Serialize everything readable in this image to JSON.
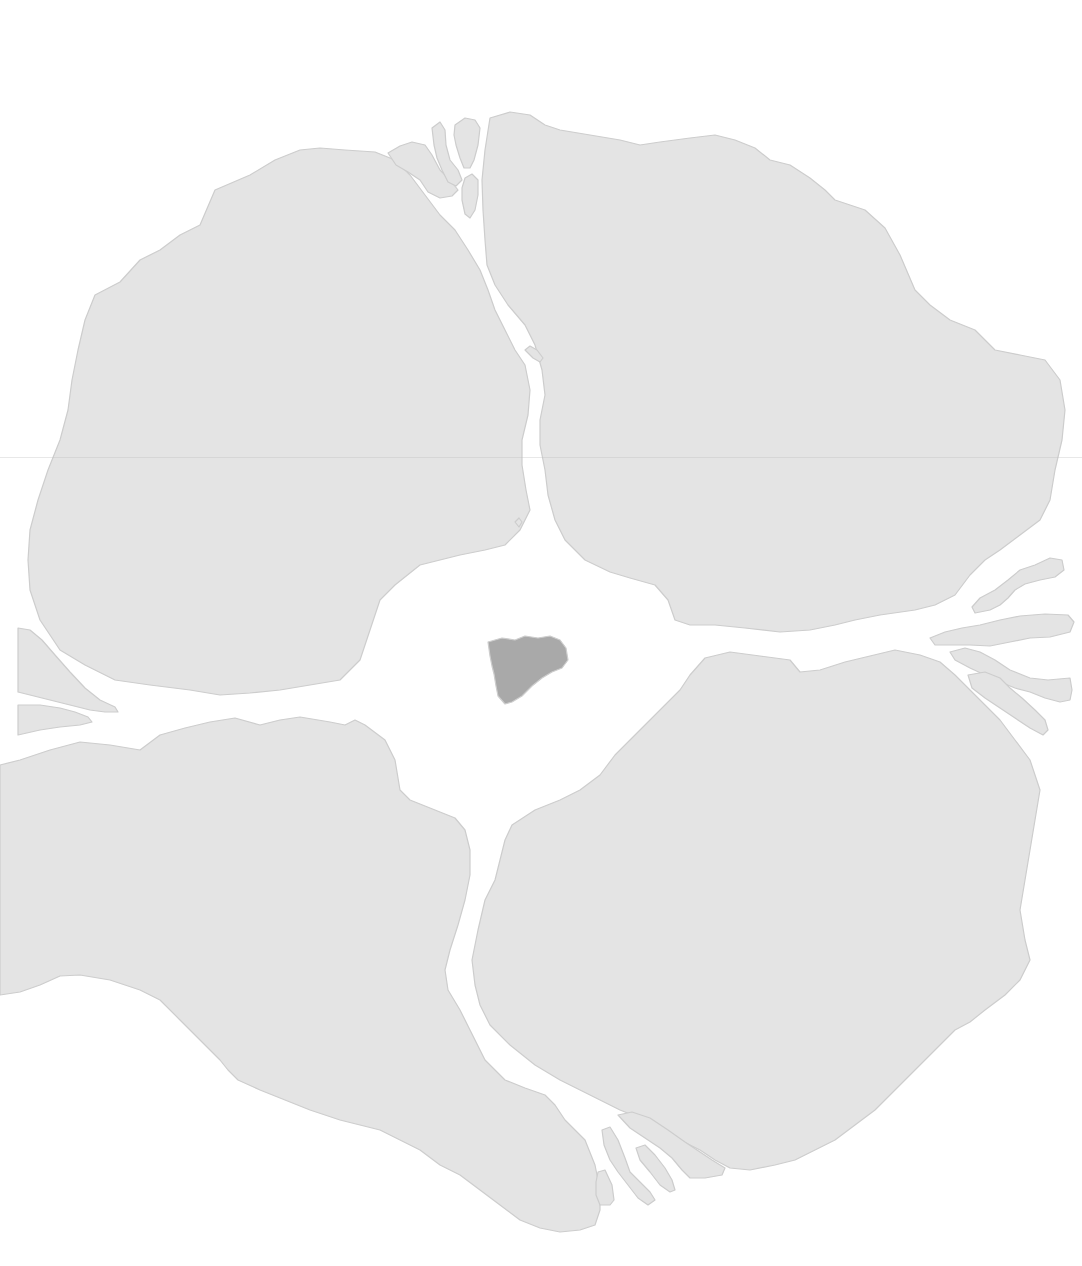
{
  "map": {
    "width": 1082,
    "height": 1266,
    "colors": {
      "sea": "#ffffff",
      "land": "#e4e4e4",
      "land_stroke": "#cdcdcd",
      "central_island": "#a9a9a9"
    },
    "regions": [
      {
        "id": "northwest-continent",
        "fill": "land",
        "points": "215,190 250,175 275,160 300,150 320,148 345,150 375,152 395,160 410,175 425,195 440,215 455,230 468,250 480,270 488,290 495,310 505,330 515,350 525,365 530,390 528,415 522,440 522,465 526,490 530,510 520,530 505,545 485,550 460,555 440,560 420,565 395,585 380,600 370,630 360,660 340,680 310,685 280,690 250,693 220,695 190,690 150,685 115,680 85,665 60,650 40,620 30,590 28,560 30,530 38,500 48,470 60,440 68,410 72,380 78,350 85,320 95,295 120,282 140,260 160,250 180,235 200,225"
      },
      {
        "id": "northeast-continent",
        "fill": "land",
        "points": "490,118 510,112 530,115 545,125 560,130 590,135 620,140 640,145 660,142 690,138 715,135 735,140 755,148 770,160 790,165 810,178 825,190 835,200 850,205 865,210 885,228 900,255 915,290 930,305 950,320 975,330 995,350 1020,355 1045,360 1060,380 1065,410 1062,440 1055,470 1050,500 1040,520 1020,535 1000,550 985,560 970,575 955,595 935,605 915,610 880,615 855,620 835,625 810,630 780,632 745,628 715,625 690,625 675,620 668,600 655,585 630,578 610,572 585,560 565,540 555,520 548,495 545,470 540,445 540,420 545,395 542,370 535,345 525,325 508,305 495,285 487,265 485,240 483,210 482,180 485,150"
      },
      {
        "id": "southwest-continent",
        "fill": "land",
        "points": "20,760 50,750 80,742 110,745 140,750 160,735 185,728 210,722 235,718 260,725 280,720 300,717 330,722 345,725 355,720 365,725 385,740 395,760 400,790 410,800 435,810 455,818 465,830 470,850 470,875 465,900 458,925 450,950 445,970 448,990 460,1010 470,1030 485,1060 505,1080 525,1088 545,1095 555,1105 565,1120 585,1140 595,1165 600,1190 600,1210 595,1225 580,1230 560,1232 540,1228 520,1220 500,1205 480,1190 460,1175 440,1165 420,1150 400,1140 380,1130 360,1125 340,1120 310,1110 285,1100 260,1090 238,1080 228,1070 220,1060 200,1040 180,1020 160,1000 140,990 110,980 80,975 60,976 40,985 20,992 0,995 0,765"
      },
      {
        "id": "southeast-continent",
        "fill": "land",
        "points": "705,658 730,652 760,656 790,660 800,672 820,670 845,662 870,656 895,650 920,655 940,662 955,675 970,690 985,705 1000,720 1015,740 1030,760 1040,790 1035,820 1030,850 1025,880 1020,910 1025,940 1030,960 1020,980 1005,995 985,1010 970,1022 955,1030 935,1050 915,1070 895,1090 875,1110 855,1125 835,1140 815,1150 795,1160 775,1165 750,1170 730,1168 715,1160 700,1150 680,1140 660,1130 640,1118 620,1110 600,1100 580,1090 560,1080 535,1065 510,1045 490,1025 480,1005 475,985 472,960 478,930 485,900 495,880 500,860 505,840 512,825 535,810 560,800 580,790 600,775 615,755 630,740 650,720 665,705 680,690 690,675"
      },
      {
        "id": "nw-islet-1",
        "fill": "land",
        "points": "388,153 400,146 412,142 425,145 432,155 440,170 450,180 458,190 452,196 440,198 428,192 420,180 408,172 396,165"
      },
      {
        "id": "nw-islet-2",
        "fill": "land",
        "points": "432,128 440,122 445,130 446,145 450,160 458,170 462,180 456,186 448,182 442,170 437,158 434,145"
      },
      {
        "id": "nw-islet-3",
        "fill": "land",
        "points": "455,125 465,118 475,120 480,128 478,145 474,160 470,168 464,168 460,158 456,145 454,135"
      },
      {
        "id": "nw-islet-4",
        "fill": "land",
        "points": "465,178 472,174 478,180 478,195 475,210 470,218 465,214 462,200 462,188"
      },
      {
        "id": "strait-islet-n",
        "fill": "land",
        "points": "525,350 530,346 537,350 543,358 540,362 533,358"
      },
      {
        "id": "strait-islet-s",
        "fill": "land",
        "points": "515,522 519,518 522,522 519,527"
      },
      {
        "id": "w-peninsula-1",
        "fill": "land",
        "points": "18,628 30,630 42,640 55,655 70,672 85,688 100,700 115,707 118,712 105,712 90,710 70,705 50,700 30,695 18,692"
      },
      {
        "id": "w-peninsula-2",
        "fill": "land",
        "points": "18,705 40,705 60,708 75,712 88,717 92,722 80,725 60,727 40,730 18,735"
      },
      {
        "id": "e-islet-1",
        "fill": "land",
        "points": "1020,570 1035,565 1050,558 1062,560 1064,570 1055,577 1040,580 1025,584 1015,590 1008,598 1000,605 990,610 975,613 972,607 980,598 995,590 1008,580"
      },
      {
        "id": "e-islet-2",
        "fill": "land",
        "points": "930,638 945,632 962,628 980,625 1000,620 1020,616 1045,614 1068,615 1074,622 1070,632 1050,637 1030,638 1010,642 990,646 970,645 950,645 935,645"
      },
      {
        "id": "e-islet-3",
        "fill": "land",
        "points": "950,652 965,648 980,652 995,660 1010,670 1030,678 1048,680 1070,678 1072,690 1070,700 1060,702 1045,698 1030,692 1015,688 1000,682 985,675 970,668 955,660"
      },
      {
        "id": "e-islet-4",
        "fill": "land",
        "points": "968,675 985,672 1000,678 1010,688 1022,698 1035,710 1045,720 1048,730 1043,735 1030,728 1015,718 1000,708 985,698 972,688"
      },
      {
        "id": "s-islet-1",
        "fill": "land",
        "points": "618,1115 632,1112 650,1118 668,1130 685,1142 700,1152 712,1160 725,1168 722,1175 705,1178 690,1178 682,1170 672,1158 660,1148 645,1138 630,1128"
      },
      {
        "id": "s-islet-2",
        "fill": "land",
        "points": "602,1130 610,1127 618,1140 625,1158 630,1172 640,1182 650,1192 655,1200 648,1205 638,1198 628,1185 618,1172 610,1160 604,1145"
      },
      {
        "id": "s-islet-3",
        "fill": "land",
        "points": "636,1148 645,1145 655,1155 665,1168 672,1180 675,1190 670,1192 660,1185 650,1172 640,1160"
      },
      {
        "id": "s-islet-4",
        "fill": "land",
        "points": "598,1172 605,1170 612,1185 614,1200 610,1205 600,1205 596,1195 596,1182"
      },
      {
        "id": "central-island",
        "fill": "central_island",
        "points": "488,642 502,638 515,640 525,636 538,638 550,636 560,640 566,648 568,660 562,668 552,672 542,678 532,686 522,696 512,702 505,704 498,696 496,686 494,674 492,666 490,656"
      }
    ]
  }
}
